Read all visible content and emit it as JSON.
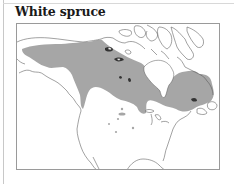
{
  "title": "White spruce",
  "map": {
    "subject": "White spruce range",
    "region": "North America (Alaska, Canada, northern United States)",
    "colors": {
      "range_fill": "#a6a6a6",
      "outline": "#555555",
      "frame": "#9a9a9a",
      "background": "#ffffff"
    }
  }
}
